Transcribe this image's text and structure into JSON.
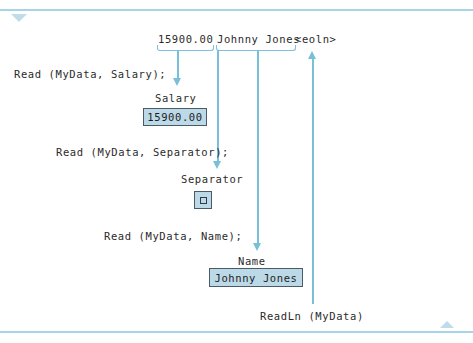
{
  "figure": {
    "input_stream": {
      "full_text": "15900.00 Johnny Jones<eoln>",
      "tokens": [
        {
          "text": "15900.00",
          "bracketed": true
        },
        {
          "text": "Johnny Jones",
          "bracketed": true
        },
        {
          "text": "<eoln>",
          "bracketed": false
        }
      ]
    },
    "statements": [
      {
        "code": "Read (MyData, Salary);"
      },
      {
        "code": "Read (MyData, Separator);"
      },
      {
        "code": "Read (MyData, Name);"
      },
      {
        "code": "ReadLn (MyData)"
      }
    ],
    "variables": [
      {
        "name": "Salary",
        "value": "15900.00",
        "value_kind": "text"
      },
      {
        "name": "Separator",
        "value": "",
        "value_kind": "space-glyph"
      },
      {
        "name": "Name",
        "value": "Johnny Jones",
        "value_kind": "text"
      }
    ],
    "colors": {
      "rule": "#a8d4e8",
      "arrow": "#79bfd8",
      "bracket": "#7fc0dc",
      "box_fill": "#bcd9e8",
      "box_border": "#4a5a66",
      "text": "#2b2b2b",
      "marker": "#bfdcea"
    },
    "markers": {
      "top_left": "triangle-down",
      "bottom_right": "triangle-up"
    }
  }
}
